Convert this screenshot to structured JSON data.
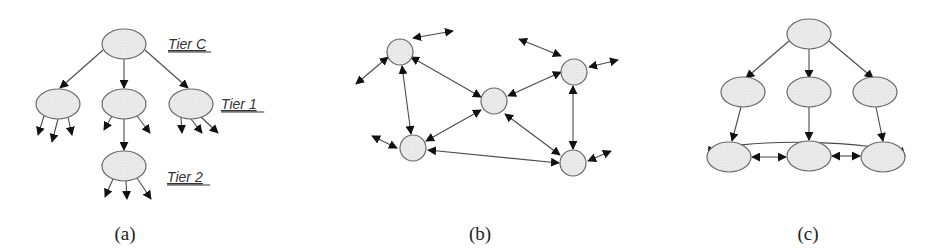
{
  "figure": {
    "panels": [
      {
        "id": "a",
        "caption": "(a)",
        "caption_pos": [
          125,
          240
        ],
        "description": "Hierarchical tree topology",
        "tier_labels": [
          {
            "text": "Tier C",
            "x": 168,
            "y": 44
          },
          {
            "text": "Tier 1",
            "x": 221,
            "y": 104
          },
          {
            "text": "Tier 2",
            "x": 167,
            "y": 177
          }
        ],
        "nodes": [
          {
            "id": "a0",
            "cx": 124,
            "cy": 44,
            "rx": 22,
            "ry": 15
          },
          {
            "id": "a1",
            "cx": 58,
            "cy": 104,
            "rx": 22,
            "ry": 15
          },
          {
            "id": "a2",
            "cx": 124,
            "cy": 104,
            "rx": 22,
            "ry": 15
          },
          {
            "id": "a3",
            "cx": 191,
            "cy": 104,
            "rx": 22,
            "ry": 15
          },
          {
            "id": "a4",
            "cx": 124,
            "cy": 166,
            "rx": 22,
            "ry": 15
          }
        ],
        "edges": [
          {
            "x1": 103,
            "y1": 50,
            "x2": 60,
            "y2": 88,
            "head": "end"
          },
          {
            "x1": 124,
            "y1": 59,
            "x2": 124,
            "y2": 88,
            "head": "end"
          },
          {
            "x1": 145,
            "y1": 50,
            "x2": 188,
            "y2": 88,
            "head": "end"
          },
          {
            "x1": 44,
            "y1": 116,
            "x2": 38,
            "y2": 135,
            "head": "end"
          },
          {
            "x1": 58,
            "y1": 119,
            "x2": 52,
            "y2": 142,
            "head": "end"
          },
          {
            "x1": 68,
            "y1": 117,
            "x2": 72,
            "y2": 135,
            "head": "end"
          },
          {
            "x1": 112,
            "y1": 116,
            "x2": 104,
            "y2": 130,
            "head": "end"
          },
          {
            "x1": 137,
            "y1": 116,
            "x2": 150,
            "y2": 133,
            "head": "end"
          },
          {
            "x1": 124,
            "y1": 119,
            "x2": 124,
            "y2": 150,
            "head": "end"
          },
          {
            "x1": 181,
            "y1": 117,
            "x2": 182,
            "y2": 133,
            "head": "end"
          },
          {
            "x1": 191,
            "y1": 119,
            "x2": 202,
            "y2": 133,
            "head": "end"
          },
          {
            "x1": 201,
            "y1": 117,
            "x2": 218,
            "y2": 133,
            "head": "end"
          },
          {
            "x1": 113,
            "y1": 179,
            "x2": 105,
            "y2": 197,
            "head": "end"
          },
          {
            "x1": 126,
            "y1": 181,
            "x2": 127,
            "y2": 199,
            "head": "end"
          },
          {
            "x1": 137,
            "y1": 178,
            "x2": 151,
            "y2": 199,
            "head": "end"
          }
        ]
      },
      {
        "id": "b",
        "caption": "(b)",
        "caption_pos": [
          480,
          240
        ],
        "description": "Peer-to-peer mesh topology",
        "tier_labels": [],
        "nodes": [
          {
            "id": "b0",
            "cx": 400,
            "cy": 52,
            "rx": 13,
            "ry": 13
          },
          {
            "id": "b1",
            "cx": 494,
            "cy": 101,
            "rx": 13,
            "ry": 13
          },
          {
            "id": "b2",
            "cx": 574,
            "cy": 72,
            "rx": 13,
            "ry": 13
          },
          {
            "id": "b3",
            "cx": 413,
            "cy": 148,
            "rx": 13,
            "ry": 13
          },
          {
            "id": "b4",
            "cx": 573,
            "cy": 163,
            "rx": 13,
            "ry": 13
          }
        ],
        "edges": [
          {
            "x1": 413,
            "y1": 38,
            "x2": 453,
            "y2": 31,
            "head": "both"
          },
          {
            "x1": 388,
            "y1": 57,
            "x2": 356,
            "y2": 84,
            "head": "both"
          },
          {
            "x1": 411,
            "y1": 57,
            "x2": 481,
            "y2": 97,
            "head": "both"
          },
          {
            "x1": 402,
            "y1": 66,
            "x2": 411,
            "y2": 134,
            "head": "both"
          },
          {
            "x1": 426,
            "y1": 141,
            "x2": 481,
            "y2": 110,
            "head": "both"
          },
          {
            "x1": 397,
            "y1": 148,
            "x2": 372,
            "y2": 136,
            "head": "both"
          },
          {
            "x1": 428,
            "y1": 150,
            "x2": 559,
            "y2": 163,
            "head": "both"
          },
          {
            "x1": 508,
            "y1": 96,
            "x2": 561,
            "y2": 72,
            "head": "both"
          },
          {
            "x1": 561,
            "y1": 56,
            "x2": 519,
            "y2": 39,
            "head": "both"
          },
          {
            "x1": 589,
            "y1": 67,
            "x2": 618,
            "y2": 60,
            "head": "both"
          },
          {
            "x1": 573,
            "y1": 86,
            "x2": 573,
            "y2": 149,
            "head": "both"
          },
          {
            "x1": 505,
            "y1": 114,
            "x2": 560,
            "y2": 155,
            "head": "both"
          },
          {
            "x1": 588,
            "y1": 161,
            "x2": 611,
            "y2": 151,
            "head": "both"
          }
        ]
      },
      {
        "id": "c",
        "caption": "(c)",
        "caption_pos": [
          808,
          240
        ],
        "description": "Hybrid hierarchical topology with peer-linked leaf tier",
        "tier_labels": [],
        "nodes": [
          {
            "id": "c0",
            "cx": 809,
            "cy": 34,
            "rx": 22,
            "ry": 15
          },
          {
            "id": "c1",
            "cx": 743,
            "cy": 92,
            "rx": 22,
            "ry": 15
          },
          {
            "id": "c2",
            "cx": 809,
            "cy": 92,
            "rx": 22,
            "ry": 15
          },
          {
            "id": "c3",
            "cx": 875,
            "cy": 92,
            "rx": 22,
            "ry": 15
          },
          {
            "id": "c4",
            "cx": 729,
            "cy": 157,
            "rx": 22,
            "ry": 15
          },
          {
            "id": "c5",
            "cx": 809,
            "cy": 156,
            "rx": 22,
            "ry": 15
          },
          {
            "id": "c6",
            "cx": 883,
            "cy": 157,
            "rx": 22,
            "ry": 15
          }
        ],
        "edges": [
          {
            "x1": 789,
            "y1": 41,
            "x2": 746,
            "y2": 78,
            "head": "end"
          },
          {
            "x1": 809,
            "y1": 49,
            "x2": 809,
            "y2": 78,
            "head": "end"
          },
          {
            "x1": 829,
            "y1": 41,
            "x2": 873,
            "y2": 78,
            "head": "end"
          },
          {
            "x1": 741,
            "y1": 107,
            "x2": 732,
            "y2": 141,
            "head": "end"
          },
          {
            "x1": 809,
            "y1": 107,
            "x2": 809,
            "y2": 140,
            "head": "end"
          },
          {
            "x1": 876,
            "y1": 107,
            "x2": 883,
            "y2": 141,
            "head": "end"
          },
          {
            "x1": 752,
            "y1": 157,
            "x2": 786,
            "y2": 157,
            "head": "both"
          },
          {
            "x1": 832,
            "y1": 156,
            "x2": 860,
            "y2": 156,
            "head": "both"
          }
        ],
        "curves": [
          {
            "d": "M 708 155 C 720 136, 890 140, 905 156",
            "head": "both"
          }
        ]
      }
    ]
  },
  "colors": {
    "node_fill": "#ebebeb",
    "node_stroke": "#6a6a6a",
    "edge": "#4a4a4a",
    "arrowhead": "#111111",
    "background": "#ffffff"
  }
}
